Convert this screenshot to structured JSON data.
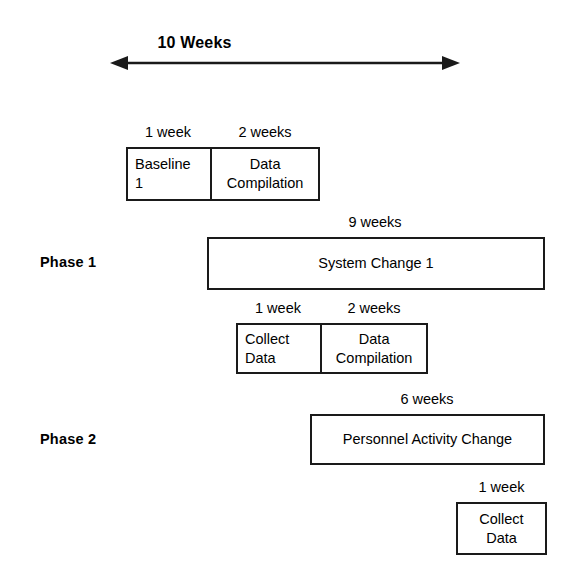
{
  "diagram": {
    "scale": {
      "label": "10 Weeks",
      "arrow_icon": "double-arrow-horizontal-icon"
    },
    "phases": [
      {
        "id": "phase-1",
        "label": "Phase 1"
      },
      {
        "id": "phase-2",
        "label": "Phase 2"
      }
    ],
    "rows": [
      {
        "id": "baseline-row",
        "durations": [
          {
            "text": "1 week"
          },
          {
            "text": "2 weeks"
          }
        ],
        "cells": [
          {
            "text": "Baseline\n1"
          },
          {
            "text": "Data\nCompilation"
          }
        ]
      },
      {
        "id": "system-change-row",
        "durations": [
          {
            "text": "9 weeks"
          }
        ],
        "cells": [
          {
            "text": "System Change 1"
          }
        ]
      },
      {
        "id": "collect-data-row",
        "durations": [
          {
            "text": "1 week"
          },
          {
            "text": "2 weeks"
          }
        ],
        "cells": [
          {
            "text": "Collect\nData"
          },
          {
            "text": "Data\nCompilation"
          }
        ]
      },
      {
        "id": "personnel-change-row",
        "durations": [
          {
            "text": "6 weeks"
          }
        ],
        "cells": [
          {
            "text": "Personnel Activity Change"
          }
        ]
      },
      {
        "id": "final-collect-row",
        "durations": [
          {
            "text": "1 week"
          }
        ],
        "cells": [
          {
            "text": "Collect\nData"
          }
        ]
      }
    ],
    "colors": {
      "stroke": "#1a1a1a",
      "fill": "#ffffff",
      "text": "#000000"
    }
  }
}
